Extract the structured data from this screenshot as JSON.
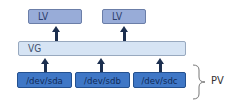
{
  "diagram": {
    "logical_volumes": [
      {
        "label": "LV"
      },
      {
        "label": "LV"
      }
    ],
    "volume_group": {
      "label": "VG"
    },
    "physical_devices": [
      {
        "label": "/dev/sda"
      },
      {
        "label": "/dev/sdb"
      },
      {
        "label": "/dev/sdc"
      }
    ],
    "brace_label": "PV",
    "colors": {
      "lv_fill": "#98acd8",
      "vg_fill": "#d6e4f4",
      "device_fill": "#3f77c6",
      "arrow": "#1c2f4f"
    }
  }
}
